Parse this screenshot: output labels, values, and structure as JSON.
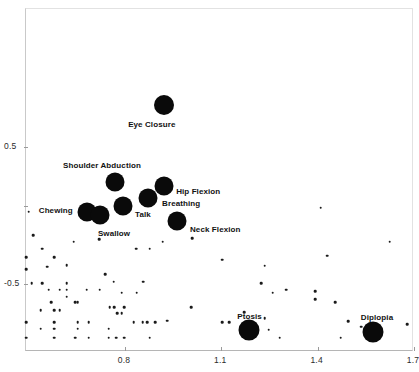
{
  "chart_data": {
    "type": "scatter",
    "title": "In-fitting items and persons",
    "title_line1": "In-fitting items",
    "title_line2": "and persons",
    "xlabel": "",
    "ylabel": "",
    "xlim": [
      0.49,
      1.7
    ],
    "ylim": [
      -1.0,
      1.0
    ],
    "xticks": [
      0.8,
      1.1,
      1.4,
      1.7
    ],
    "xticklabels": [
      "0.8",
      "1.1",
      "1.4",
      "1.7"
    ],
    "yticks": [
      0.5,
      -0.5
    ],
    "yticklabels": [
      "0.5",
      "-0.5"
    ],
    "grid": false,
    "legend": "none",
    "series": [
      {
        "name": "Labeled items",
        "marker": "filled-circle-large",
        "color": "#0a0a0a",
        "points": [
          {
            "label": "Eye Closure",
            "x": 0.925,
            "y": 0.8,
            "size": 20,
            "label_dx": -36,
            "label_dy": 16
          },
          {
            "label": "Shoulder Abduction",
            "x": 0.772,
            "y": 0.24,
            "size": 19,
            "label_dx": -52,
            "label_dy": -20
          },
          {
            "label": "Hip Flexion",
            "x": 0.925,
            "y": 0.21,
            "size": 19,
            "label_dx": 12,
            "label_dy": 2
          },
          {
            "label": "Breathing",
            "x": 0.875,
            "y": 0.12,
            "size": 19,
            "label_dx": 14,
            "label_dy": 2
          },
          {
            "label": "Talk",
            "x": 0.797,
            "y": 0.06,
            "size": 19,
            "label_dx": 12,
            "label_dy": 5
          },
          {
            "label": "Chewing",
            "x": 0.684,
            "y": 0.02,
            "size": 19,
            "label_dx": -48,
            "label_dy": -5
          },
          {
            "label": "Swallow",
            "x": 0.725,
            "y": 0.0,
            "size": 19,
            "label_dx": -2,
            "label_dy": 15
          },
          {
            "label": "Neck Flexion",
            "x": 0.965,
            "y": -0.05,
            "size": 19,
            "label_dx": 13,
            "label_dy": 5
          },
          {
            "label": "Ptosis",
            "x": 1.19,
            "y": -0.84,
            "size": 21,
            "label_dx": -12,
            "label_dy": -17
          },
          {
            "label": "Diplopia",
            "x": 1.575,
            "y": -0.86,
            "size": 21,
            "label_dx": -12,
            "label_dy": -18
          }
        ]
      },
      {
        "name": "Persons",
        "marker": "filled-circle-small",
        "color": "#1a1a1a",
        "points": [
          {
            "x": 0.503,
            "y": 0.02
          },
          {
            "x": 0.517,
            "y": -0.15
          },
          {
            "x": 0.545,
            "y": -0.25
          },
          {
            "x": 0.583,
            "y": -0.31
          },
          {
            "x": 0.722,
            "y": -0.18
          },
          {
            "x": 0.643,
            "y": -0.2
          },
          {
            "x": 0.495,
            "y": -0.4
          },
          {
            "x": 0.621,
            "y": -0.37
          },
          {
            "x": 0.512,
            "y": -0.5
          },
          {
            "x": 0.545,
            "y": -0.5
          },
          {
            "x": 0.621,
            "y": -0.5
          },
          {
            "x": 0.565,
            "y": -0.55
          },
          {
            "x": 0.6,
            "y": -0.55
          },
          {
            "x": 0.621,
            "y": -0.55
          },
          {
            "x": 0.684,
            "y": -0.55
          },
          {
            "x": 0.724,
            "y": -0.55
          },
          {
            "x": 0.621,
            "y": -0.6
          },
          {
            "x": 0.574,
            "y": -0.64
          },
          {
            "x": 0.648,
            "y": -0.64
          },
          {
            "x": 0.656,
            "y": -0.64
          },
          {
            "x": 0.768,
            "y": -0.49
          },
          {
            "x": 0.86,
            "y": -0.49
          },
          {
            "x": 0.793,
            "y": -0.57
          },
          {
            "x": 0.84,
            "y": -0.57
          },
          {
            "x": 0.838,
            "y": -0.25
          },
          {
            "x": 0.88,
            "y": -0.25
          },
          {
            "x": 0.92,
            "y": -0.2
          },
          {
            "x": 0.755,
            "y": -0.675
          },
          {
            "x": 0.77,
            "y": -0.675
          },
          {
            "x": 0.8,
            "y": -0.675
          },
          {
            "x": 0.54,
            "y": -0.7
          },
          {
            "x": 0.583,
            "y": -0.7
          },
          {
            "x": 0.6,
            "y": -0.7
          },
          {
            "x": 0.779,
            "y": -0.72
          },
          {
            "x": 0.793,
            "y": -0.72
          },
          {
            "x": 0.495,
            "y": -0.785
          },
          {
            "x": 0.583,
            "y": -0.785
          },
          {
            "x": 0.656,
            "y": -0.785
          },
          {
            "x": 0.69,
            "y": -0.785
          },
          {
            "x": 0.83,
            "y": -0.785
          },
          {
            "x": 0.858,
            "y": -0.785
          },
          {
            "x": 0.872,
            "y": -0.785
          },
          {
            "x": 0.897,
            "y": -0.785
          },
          {
            "x": 0.54,
            "y": -0.835
          },
          {
            "x": 0.583,
            "y": -0.835
          },
          {
            "x": 0.656,
            "y": -0.835
          },
          {
            "x": 0.752,
            "y": -0.835
          },
          {
            "x": 0.495,
            "y": -0.9
          },
          {
            "x": 0.583,
            "y": -0.9
          },
          {
            "x": 0.648,
            "y": -0.9
          },
          {
            "x": 0.69,
            "y": -0.9
          },
          {
            "x": 0.752,
            "y": -0.9
          },
          {
            "x": 0.775,
            "y": -0.9
          },
          {
            "x": 0.8,
            "y": -0.9
          },
          {
            "x": 1.105,
            "y": -0.785
          },
          {
            "x": 1.128,
            "y": -0.785
          },
          {
            "x": 1.01,
            "y": -0.675
          },
          {
            "x": 1.228,
            "y": -0.5
          },
          {
            "x": 1.263,
            "y": -0.57
          },
          {
            "x": 1.175,
            "y": -0.715
          },
          {
            "x": 1.238,
            "y": -0.755
          },
          {
            "x": 1.25,
            "y": -0.84
          },
          {
            "x": 1.285,
            "y": -0.9
          },
          {
            "x": 1.305,
            "y": -0.55
          },
          {
            "x": 1.105,
            "y": -0.33
          },
          {
            "x": 1.012,
            "y": -0.175
          },
          {
            "x": 1.238,
            "y": -0.375
          },
          {
            "x": 1.395,
            "y": -0.56
          },
          {
            "x": 1.395,
            "y": -0.62
          },
          {
            "x": 1.412,
            "y": 0.05
          },
          {
            "x": 1.432,
            "y": -0.3
          },
          {
            "x": 1.458,
            "y": -0.64
          },
          {
            "x": 1.475,
            "y": -0.9
          },
          {
            "x": 1.498,
            "y": -0.78
          },
          {
            "x": 1.538,
            "y": -0.82
          },
          {
            "x": 1.628,
            "y": -0.2
          },
          {
            "x": 1.682,
            "y": -0.8
          },
          {
            "x": 0.935,
            "y": -0.775
          },
          {
            "x": 0.88,
            "y": -0.9
          },
          {
            "x": 0.742,
            "y": -0.435
          },
          {
            "x": 0.56,
            "y": -0.38
          },
          {
            "x": 0.495,
            "y": -0.31
          }
        ]
      }
    ]
  }
}
